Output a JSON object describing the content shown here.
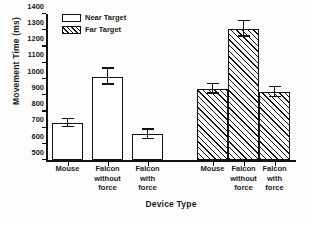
{
  "chart_data": {
    "type": "bar",
    "title": "",
    "xlabel": "Device Type",
    "ylabel": "Movement Time  (ms)",
    "ylim": [
      500,
      1400
    ],
    "ytick_step": 100,
    "yticks": [
      500,
      600,
      700,
      800,
      900,
      1000,
      1100,
      1200,
      1300,
      1400
    ],
    "ytick_labels": [
      "500",
      "600",
      "700",
      "800",
      "900",
      "1000",
      "1100",
      "1200",
      "1300",
      "1400"
    ],
    "grid": false,
    "legend_position": "top-left",
    "categories": [
      "Mouse",
      "Falcon without force",
      "Falcon with force"
    ],
    "series": [
      {
        "name": "Near Target",
        "fill": "open",
        "values": [
          730,
          1015,
          660
        ],
        "errors_upper": [
          755,
          1065,
          690
        ],
        "errors_lower": [
          705,
          965,
          630
        ]
      },
      {
        "name": "Far Target",
        "fill": "hatched",
        "values": [
          940,
          1310,
          920
        ],
        "errors_upper": [
          970,
          1355,
          950
        ],
        "errors_lower": [
          910,
          1260,
          890
        ]
      }
    ],
    "bars": [
      {
        "label": "Mouse",
        "group": "Near Target",
        "value": 730,
        "err_hi": 755,
        "err_lo": 705
      },
      {
        "label": "Falcon without force",
        "group": "Near Target",
        "value": 1015,
        "err_hi": 1065,
        "err_lo": 965
      },
      {
        "label": "Falcon with force",
        "group": "Near Target",
        "value": 660,
        "err_hi": 690,
        "err_lo": 630
      },
      {
        "label": "Mouse",
        "group": "Far Target",
        "value": 940,
        "err_hi": 970,
        "err_lo": 910
      },
      {
        "label": "Falcon without force",
        "group": "Far Target",
        "value": 1310,
        "err_hi": 1355,
        "err_lo": 1260
      },
      {
        "label": "Falcon with force",
        "group": "Far Target",
        "value": 920,
        "err_hi": 950,
        "err_lo": 890
      }
    ]
  },
  "axes": {
    "y_title": "Movement Time  (ms)",
    "x_title": "Device Type"
  },
  "legend": {
    "items": [
      {
        "label": "Near Target",
        "fill": "open"
      },
      {
        "label": "Far Target",
        "fill": "hatched"
      }
    ]
  },
  "x_labels": [
    {
      "line1": "Mouse",
      "line2": "",
      "line3": ""
    },
    {
      "line1": "Falcon",
      "line2": "without",
      "line3": "force"
    },
    {
      "line1": "Falcon",
      "line2": "with",
      "line3": "force"
    },
    {
      "line1": "Mouse",
      "line2": "",
      "line3": ""
    },
    {
      "line1": "Falcon",
      "line2": "without",
      "line3": "force"
    },
    {
      "line1": "Falcon",
      "line2": "with",
      "line3": "force"
    }
  ],
  "colors": {
    "axis": "#111111",
    "bar_stroke": "#111111",
    "bar_fill_near": "#ffffff",
    "background": "#ffffff"
  }
}
